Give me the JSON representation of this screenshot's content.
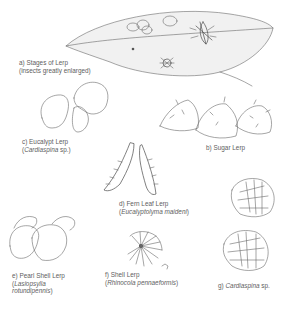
{
  "figure": {
    "labels": {
      "a": {
        "line1": "a) Stages of Lerp",
        "line2": "(insects greatly enlarged)"
      },
      "b": {
        "line1": "b) Sugar Lerp"
      },
      "c": {
        "line1": "c) Eucalypt Lerp",
        "line2_prefix": "(",
        "line2_italic": "Cardiaspina",
        "line2_suffix": " sp.)"
      },
      "d": {
        "line1": "d) Fern Leaf Lerp",
        "line2_prefix": "(",
        "line2_italic": "Eucalyptolyma maideni",
        "line2_suffix": ")"
      },
      "e": {
        "line1": "e) Pearl Shell Lerp",
        "line2_prefix": "(",
        "line2_italic": "Lasiopsylla",
        "line3_italic": "rotundipennis",
        "line3_suffix": ")"
      },
      "f": {
        "line1": "f) Shell Lerp",
        "line2_prefix": "(",
        "line2_italic": "Rhinocola pennaeformis",
        "line2_suffix": ")"
      },
      "g": {
        "line1_prefix": "g) ",
        "line1_italic": "Cardiaspina",
        "line1_suffix": " sp."
      }
    },
    "colors": {
      "ink": "#6a6a6a",
      "text": "#5e5e5e",
      "background": "#ffffff",
      "fill": "#f1f1f1"
    }
  }
}
